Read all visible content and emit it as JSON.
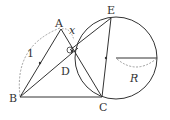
{
  "diagram": {
    "type": "geometry",
    "points": {
      "A": {
        "label": "A",
        "x": 61,
        "y": 29
      },
      "B": {
        "label": "B",
        "x": 20,
        "y": 97
      },
      "C": {
        "label": "C",
        "x": 102,
        "y": 97
      },
      "D": {
        "label": "D",
        "x": 70,
        "y": 50
      },
      "E": {
        "label": "E",
        "x": 111,
        "y": 18
      }
    },
    "circle": {
      "cx": 116,
      "cy": 58,
      "r": 41
    },
    "labels": {
      "side_AB": "1",
      "angle_x": "x",
      "radius": "R"
    },
    "segments": [
      "AB",
      "AC",
      "BC",
      "BD",
      "EC",
      "ED"
    ],
    "colors": {
      "stroke": "#333333",
      "dashed": "#888888"
    }
  }
}
